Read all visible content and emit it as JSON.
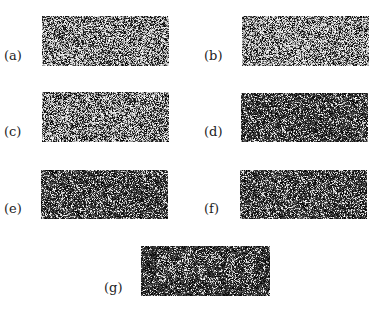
{
  "figure": {
    "panels": [
      {
        "id": "a",
        "label": "(a)",
        "brightness": 0.55,
        "x": 42,
        "y": 16,
        "w": 127,
        "h": 50,
        "label_x": 4,
        "label_y": 56
      },
      {
        "id": "b",
        "label": "(b)",
        "brightness": 0.58,
        "x": 242,
        "y": 16,
        "w": 127,
        "h": 50,
        "label_x": 204,
        "label_y": 56
      },
      {
        "id": "c",
        "label": "(c)",
        "brightness": 0.52,
        "x": 42,
        "y": 92,
        "w": 127,
        "h": 50,
        "label_x": 4,
        "label_y": 132
      },
      {
        "id": "d",
        "label": "(d)",
        "brightness": 0.25,
        "x": 241,
        "y": 93,
        "w": 127,
        "h": 49,
        "label_x": 204,
        "label_y": 132
      },
      {
        "id": "e",
        "label": "(e)",
        "brightness": 0.27,
        "x": 41,
        "y": 170,
        "w": 127,
        "h": 49,
        "label_x": 4,
        "label_y": 209
      },
      {
        "id": "f",
        "label": "(f)",
        "brightness": 0.28,
        "x": 240,
        "y": 170,
        "w": 127,
        "h": 49,
        "label_x": 204,
        "label_y": 209
      },
      {
        "id": "g",
        "label": "(g)",
        "brightness": 0.18,
        "x": 141,
        "y": 246,
        "w": 129,
        "h": 50,
        "label_x": 104,
        "label_y": 288,
        "embedded_text": "MCU"
      }
    ]
  }
}
